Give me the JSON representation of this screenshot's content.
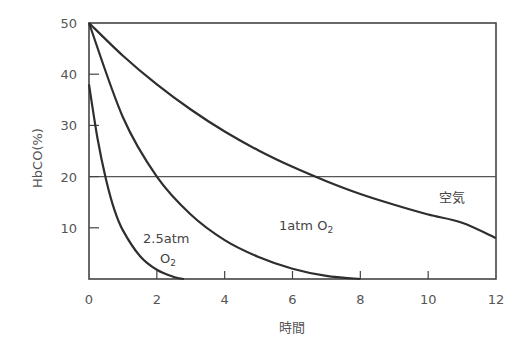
{
  "chart_data": {
    "type": "line",
    "title": "",
    "xlabel": "時間",
    "ylabel": "HbCO(%)",
    "xlim": [
      0,
      12
    ],
    "ylim": [
      0,
      50
    ],
    "xticks": [
      0,
      2,
      4,
      6,
      8,
      10,
      12
    ],
    "xtick_labels": [
      "0",
      "2",
      "4",
      "6",
      "8",
      "10",
      "12"
    ],
    "yticks": [
      10,
      20,
      30,
      40,
      50
    ],
    "ytick_labels": [
      "10",
      "20",
      "30",
      "40",
      "50"
    ],
    "grid": false,
    "reference_lines": [
      {
        "axis": "y",
        "value": 20
      }
    ],
    "series": [
      {
        "name": "空気",
        "x": [
          0,
          1,
          2,
          3,
          4,
          5,
          6,
          7,
          8,
          9,
          10,
          11,
          12
        ],
        "y": [
          50,
          43.6,
          38.0,
          33.1,
          28.8,
          25.1,
          21.9,
          19.1,
          16.6,
          14.5,
          12.6,
          11.0,
          8
        ]
      },
      {
        "name": "1atm O2",
        "x": [
          0,
          1,
          2,
          3,
          4,
          5,
          6,
          7,
          8
        ],
        "y": [
          50,
          31.6,
          20.0,
          12.6,
          7.6,
          4.3,
          2.0,
          0.6,
          0
        ]
      },
      {
        "name": "2.5atm O2",
        "x": [
          0,
          0.25,
          0.5,
          0.75,
          1,
          1.5,
          2,
          2.5,
          2.8
        ],
        "y": [
          38,
          27.5,
          19.5,
          13.5,
          9.5,
          4.5,
          1.8,
          0.4,
          0
        ]
      }
    ],
    "annotations": [
      {
        "text": "空気",
        "x": 11.4,
        "y": 16
      },
      {
        "text": "1atm O2",
        "x": 6.3,
        "y": 10
      },
      {
        "text": "2.5atm O2",
        "x": 2.2,
        "y": 8
      }
    ]
  },
  "labels": {
    "ylabel": "HbCO(%)",
    "xlabel": "時間",
    "air": "空気",
    "one_atm_main": "1atm O",
    "one_atm_sub": "2",
    "two_atm_main": "2.5atm",
    "two_atm_o": "O",
    "two_atm_sub": "2"
  }
}
